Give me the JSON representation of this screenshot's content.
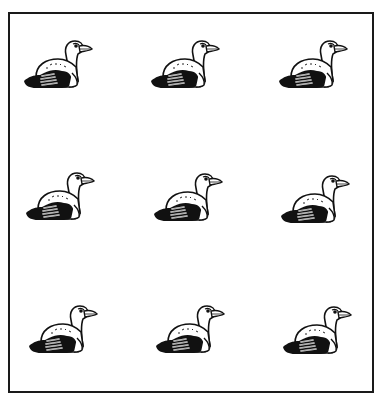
{
  "figure": {
    "type": "clip-art grid",
    "rows": 3,
    "columns": 3,
    "count": 9,
    "colors": {
      "ink": "#111111",
      "background": "#ffffff",
      "border": "#1a1a1a"
    },
    "birds": [
      {
        "row": 1,
        "col": 1,
        "x": 22,
        "y": 37
      },
      {
        "row": 1,
        "col": 2,
        "x": 149,
        "y": 37
      },
      {
        "row": 1,
        "col": 3,
        "x": 277,
        "y": 37
      },
      {
        "row": 2,
        "col": 1,
        "x": 24,
        "y": 169
      },
      {
        "row": 2,
        "col": 2,
        "x": 152,
        "y": 170
      },
      {
        "row": 2,
        "col": 3,
        "x": 279,
        "y": 172
      },
      {
        "row": 3,
        "col": 1,
        "x": 27,
        "y": 302
      },
      {
        "row": 3,
        "col": 2,
        "x": 154,
        "y": 302
      },
      {
        "row": 3,
        "col": 3,
        "x": 281,
        "y": 303
      }
    ]
  }
}
